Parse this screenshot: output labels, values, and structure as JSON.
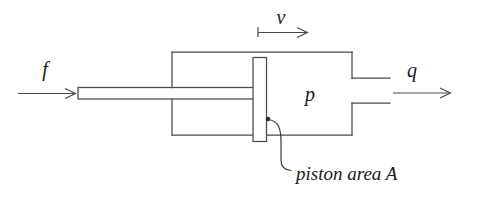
{
  "diagram": {
    "background_color": "#ffffff",
    "line_color": "#4a4a4a",
    "text_color": "#1a1a1a",
    "labels": {
      "force": "f",
      "velocity": "v",
      "pressure": "p",
      "flow": "q",
      "piston_area_caption": "piston area A"
    },
    "arrows": [
      {
        "name": "force-arrow",
        "label": "f",
        "direction": "right"
      },
      {
        "name": "velocity-arrow",
        "label": "v",
        "direction": "right"
      },
      {
        "name": "flow-arrow",
        "label": "q",
        "direction": "right"
      }
    ],
    "parts": [
      {
        "name": "piston-rod"
      },
      {
        "name": "cylinder-body"
      },
      {
        "name": "piston-plate"
      },
      {
        "name": "outlet-port"
      }
    ]
  }
}
